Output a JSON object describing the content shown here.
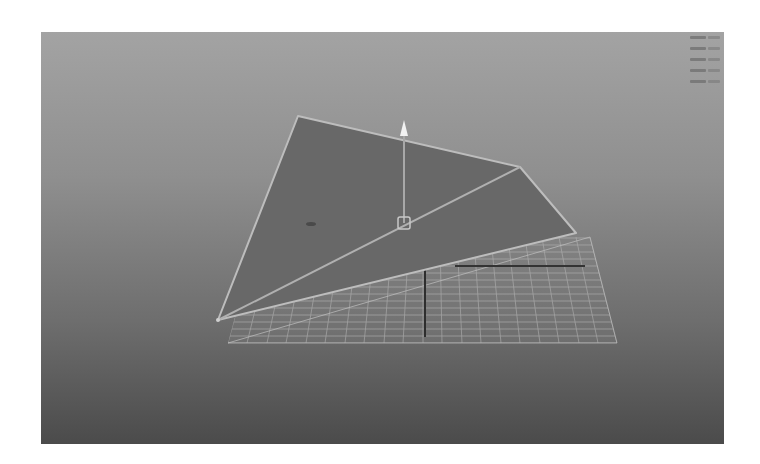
{
  "app": {
    "panel": "3d-viewport",
    "view": "perspective"
  },
  "viewport": {
    "background_top": "#a3a3a3",
    "background_bottom": "#4b4b4b"
  },
  "hud": {
    "rows": [
      {
        "label": "",
        "value": ""
      },
      {
        "label": "",
        "value": ""
      },
      {
        "label": "",
        "value": ""
      },
      {
        "label": "",
        "value": ""
      },
      {
        "label": "",
        "value": ""
      }
    ],
    "note": "Heads-up display text in top-right is illegible (5 rows)"
  },
  "scene": {
    "polygon": {
      "name": "selected polygon plane",
      "face_color": "#686868",
      "edge_color": "#b8b8b8",
      "vertices": [
        [
          257,
          84
        ],
        [
          479,
          135
        ],
        [
          535,
          201
        ],
        [
          177,
          288
        ]
      ],
      "diagonal": [
        [
          177,
          288
        ],
        [
          479,
          135
        ]
      ]
    },
    "manipulator": {
      "center": [
        363,
        191
      ],
      "arrow_tip": [
        363,
        90
      ],
      "color": "#e8e8e8"
    },
    "grid": {
      "color": "#b0b0b0",
      "corners": [
        [
          187,
          311
        ],
        [
          576,
          311
        ],
        [
          549,
          205
        ],
        [
          215,
          205
        ]
      ]
    },
    "axes": {
      "color": "#303030",
      "x_axis": [
        [
          414,
          234
        ],
        [
          544,
          234
        ]
      ],
      "z_axis": [
        [
          384,
          236
        ],
        [
          384,
          305
        ]
      ]
    },
    "pivot_mark": [
      270,
      192
    ]
  }
}
